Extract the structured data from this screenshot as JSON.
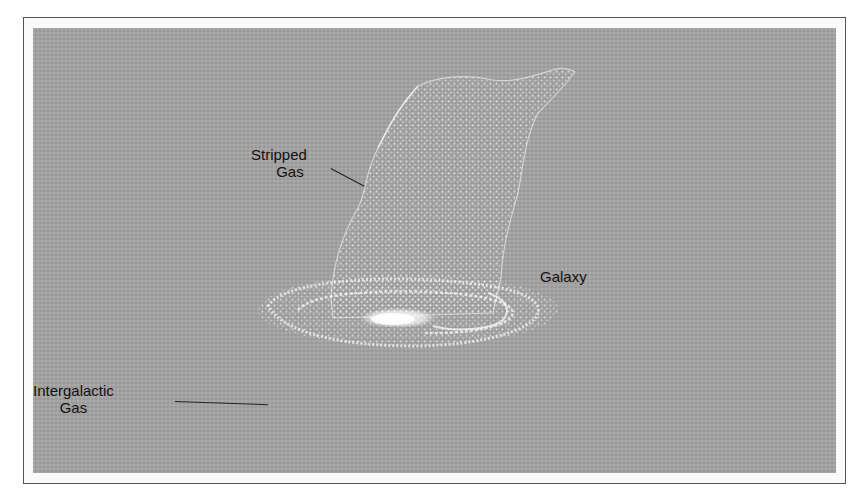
{
  "figure": {
    "labels": {
      "stripped_gas": [
        "Stripped",
        "Gas"
      ],
      "galaxy": "Galaxy",
      "intergalactic_gas": [
        "Intergalactic",
        "Gas"
      ]
    },
    "colors": {
      "background": "#a1a1a1",
      "gas_particles": "#f2f2f2",
      "galaxy_core": "#ffffff",
      "text": "#111111",
      "frame": "#555555"
    }
  }
}
